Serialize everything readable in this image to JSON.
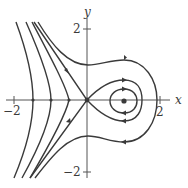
{
  "figure": {
    "type": "phase-portrait",
    "axes": {
      "x_label": "x",
      "y_label": "y",
      "x_ticks": [
        {
          "value": -2,
          "label": "−2"
        },
        {
          "value": 2,
          "label": "2"
        }
      ],
      "y_ticks": [
        {
          "value": 2,
          "label": "2"
        },
        {
          "value": -2,
          "label": "−2"
        }
      ],
      "x_range": [
        -2.3,
        2.3
      ],
      "y_range": [
        -2.3,
        2.3
      ]
    },
    "equilibria": [
      {
        "name": "saddle",
        "x": 0,
        "y": 0
      },
      {
        "name": "center",
        "x": 1,
        "y": 0
      }
    ],
    "colors": {
      "curve": "#3a3a3a",
      "axis": "#555555",
      "background": "#ffffff"
    }
  }
}
